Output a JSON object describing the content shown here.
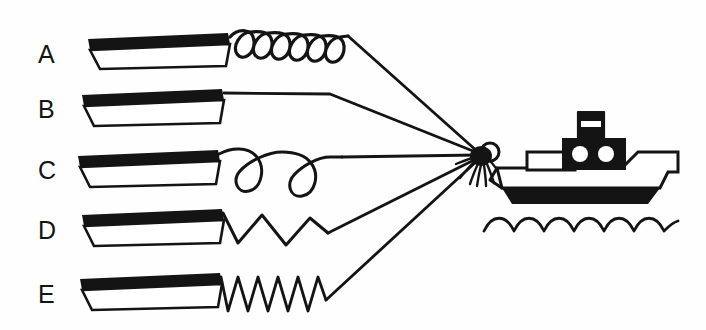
{
  "figure": {
    "background_color": "#fefefe",
    "ink_color": "#141414",
    "paper_color": "#ffffff",
    "width": 706,
    "height": 330
  },
  "labels": {
    "a": "A",
    "b": "B",
    "c": "C",
    "d": "D",
    "e": "E"
  },
  "rows": [
    {
      "label": "A",
      "coupling_type": "tight-helical-spring",
      "coil_count": 6,
      "barge_y": 52,
      "description": "Barge connected by a tightly wound helical spring"
    },
    {
      "label": "B",
      "coupling_type": "straight-rope",
      "coil_count": 0,
      "barge_y": 107,
      "description": "Barge connected by a straight inextensible rope"
    },
    {
      "label": "C",
      "coupling_type": "large-loose-loops",
      "coil_count": 2,
      "barge_y": 168,
      "description": "Barge connected by a rope with two large loose loops"
    },
    {
      "label": "D",
      "coupling_type": "wide-zigzag-spring",
      "coil_count": 3,
      "barge_y": 228,
      "description": "Barge connected by a wide-amplitude zigzag spring"
    },
    {
      "label": "E",
      "coupling_type": "tight-zigzag-spring",
      "coil_count": 10,
      "barge_y": 292,
      "description": "Barge connected by a tight zigzag spring"
    }
  ],
  "boat": {
    "name": "tugboat",
    "parts": [
      "hull",
      "deck-band",
      "forward-cabin",
      "superstructure",
      "porthole-left",
      "porthole-right",
      "smokestack",
      "smokestack-band"
    ],
    "porthole_count": 2
  },
  "water": {
    "name": "waves",
    "wave_count": 6
  },
  "tow_point": {
    "name": "tow-hitch-knot",
    "x": 483,
    "y": 155,
    "frayed_strand_count": 7,
    "has_ring": true
  }
}
